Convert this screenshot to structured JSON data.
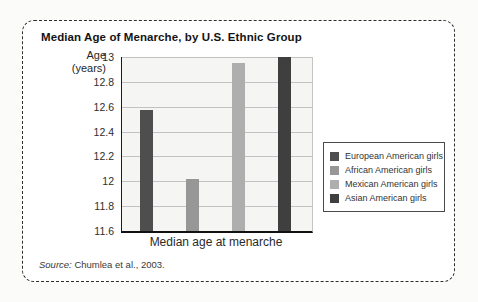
{
  "figure": {
    "title": "Median Age of Menarche, by U.S. Ethnic Group",
    "y_axis_label_line1": "Age",
    "y_axis_label_line2": "(years)",
    "x_axis_label": "Median age at menarche",
    "source_prefix": "Source:",
    "source_citation": " Chumlea et al., 2003."
  },
  "chart_data": {
    "type": "bar",
    "title": "Median Age of Menarche, by U.S. Ethnic Group",
    "xlabel": "Median age at menarche",
    "ylabel": "Age (years)",
    "ylim": [
      11.6,
      13
    ],
    "yticks": [
      13,
      12.8,
      12.6,
      12.4,
      12.2,
      12,
      11.8,
      11.6
    ],
    "grid": true,
    "legend_position": "right",
    "series": [
      {
        "name": "European American girls",
        "value": 12.57,
        "color": "#4e4e4e"
      },
      {
        "name": "African American girls",
        "value": 12.02,
        "color": "#979797"
      },
      {
        "name": "Mexican American girls",
        "value": 12.95,
        "color": "#aeaeae"
      },
      {
        "name": "Asian American girls",
        "value": 13.0,
        "color": "#3f3f3f"
      }
    ],
    "source": "Source: Chumlea et al., 2003.",
    "colors": {
      "plot_background": "#f5f5f4",
      "gridline": "#c2c2c2",
      "axis": "#111111",
      "panel_border": "#2d2d2d"
    }
  }
}
